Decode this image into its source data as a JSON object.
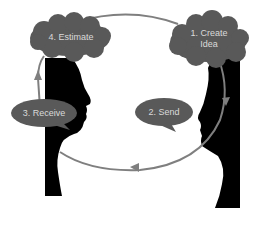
{
  "diagram": {
    "type": "communication-cycle",
    "colors": {
      "silhouette": "#000000",
      "shape_fill": "#595959",
      "arrow": "#7f7f7f",
      "label_text": "#d9d9d9",
      "background": "#ffffff"
    },
    "steps": [
      {
        "id": 1,
        "label": "1.  Create\nIdea",
        "shape": "cloud",
        "position": "top-right"
      },
      {
        "id": 2,
        "label": "2. Send",
        "shape": "speech-bubble",
        "position": "middle-right"
      },
      {
        "id": 3,
        "label": "3. Receive",
        "shape": "speech-bubble",
        "position": "middle-left"
      },
      {
        "id": 4,
        "label": "4. Estimate",
        "shape": "cloud",
        "position": "top-left"
      }
    ],
    "figures": [
      {
        "name": "left-profile",
        "facing": "right"
      },
      {
        "name": "right-profile",
        "facing": "left"
      }
    ],
    "arrows": [
      {
        "from": "1. Create Idea",
        "to": "2. Send",
        "direction": "down along right face"
      },
      {
        "from": "2. Send",
        "to": "3. Receive",
        "direction": "bottom arc right-to-left"
      },
      {
        "from": "3. Receive",
        "to": "4. Estimate",
        "direction": "up along left face"
      },
      {
        "from": "4. Estimate",
        "to": "1. Create Idea",
        "direction": "top arc left-to-right"
      }
    ]
  }
}
